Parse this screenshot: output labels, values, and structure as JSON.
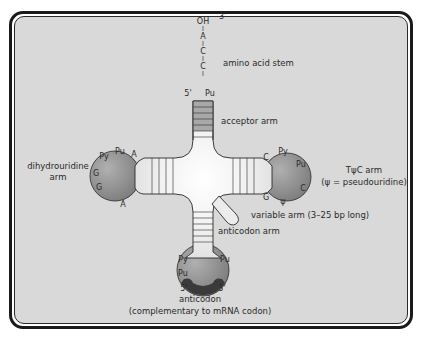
{
  "diagram": {
    "colors": {
      "background": "#d9d9d9",
      "frame": "#1a1a1a",
      "loop_fill": "#8f8f8f",
      "stem_fill": "#ededed",
      "acceptor_shade": "#a8a8a8",
      "anticodon_shade": "#3a3a3a",
      "line": "#2a2a2a"
    },
    "acceptor_end": {
      "three_prime": "3'",
      "sequence": [
        "OH",
        "A",
        "C",
        "C",
        "Pu"
      ],
      "five_prime": "5'"
    },
    "labels": {
      "amino_acid_stem": "amino acid stem",
      "acceptor_arm": "acceptor arm",
      "dihydrouridine_arm_line1": "dihydrouridine",
      "dihydrouridine_arm_line2": "arm",
      "tpsic_arm_line1": "TψC arm",
      "tpsic_arm_line2": "(ψ = pseudouridine)",
      "variable_arm": "variable arm (3–25 bp long)",
      "anticodon_arm": "anticodon arm",
      "anticodon_line1": "anticodon",
      "anticodon_line2": "(complementary to mRNA codon)"
    },
    "d_loop_nucleotides": {
      "pu": "Pu",
      "a_top": "A",
      "py": "Py",
      "g1": "G",
      "g2": "G",
      "a_bottom": "A"
    },
    "tpsic_loop_nucleotides": {
      "c_top": "C",
      "py": "Py",
      "pu": "Pu",
      "c_right": "C",
      "psi": "ψ",
      "g": "G"
    },
    "anticodon_loop_nucleotides": {
      "py": "Py",
      "pu_left": "Pu",
      "pu_right": "Pu",
      "five_prime": "5'",
      "three_prime": "3'"
    }
  }
}
